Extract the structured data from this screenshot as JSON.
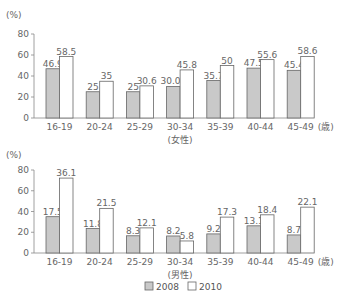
{
  "colors": {
    "bar_2008_fill": "#c9c9c9",
    "bar_2010_fill": "#ffffff",
    "bar_stroke": "#666666",
    "axis": "#888888"
  },
  "legend": [
    {
      "label": "2008",
      "swatch": "gray"
    },
    {
      "label": "2010",
      "swatch": "white"
    }
  ],
  "chart_data": [
    {
      "type": "bar",
      "title": "",
      "subtitle": "(女性)",
      "ylabel": "(%)",
      "xlabel_unit": "(歳)",
      "ylim": [
        0,
        80
      ],
      "yticks": [
        0,
        20,
        40,
        60,
        80
      ],
      "grid": false,
      "legend_position": "bottom",
      "categories": [
        "16-19",
        "20-24",
        "25-29",
        "30-34",
        "35-39",
        "40-44",
        "45-49"
      ],
      "series": [
        {
          "name": "2008",
          "values": [
            46.9,
            25,
            25,
            30.04,
            35.7,
            47.5,
            45.4
          ],
          "labels": [
            "46.9",
            "25",
            "25",
            "30.04",
            "35.7",
            "47.5",
            "45.4"
          ]
        },
        {
          "name": "2010",
          "values": [
            58.5,
            35,
            30.6,
            45.8,
            50,
            55.6,
            58.6
          ],
          "labels": [
            "58.5",
            "35",
            "30.6",
            "45.8",
            "50",
            "55.6",
            "58.6"
          ]
        }
      ],
      "drawn_scale": 1
    },
    {
      "type": "bar",
      "title": "",
      "subtitle": "(男性)",
      "ylabel": "(%)",
      "xlabel_unit": "(歳)",
      "ylim": [
        0,
        80
      ],
      "yticks": [
        0,
        20,
        40,
        60,
        80
      ],
      "grid": false,
      "legend_position": "bottom",
      "categories": [
        "16-19",
        "20-24",
        "25-29",
        "30-34",
        "35-39",
        "40-44",
        "45-49"
      ],
      "series": [
        {
          "name": "2008",
          "values": [
            17.5,
            11.8,
            8.3,
            8.2,
            9.2,
            13.1,
            8.7
          ],
          "labels": [
            "17.5",
            "11.8",
            "8.3",
            "8.2",
            "9.2",
            "13.1",
            "8.7"
          ]
        },
        {
          "name": "2010",
          "values": [
            36.1,
            21.5,
            12.1,
            5.8,
            17.3,
            18.4,
            22.1
          ],
          "labels": [
            "36.1",
            "21.5",
            "12.1",
            "5.8",
            "17.3",
            "18.4",
            "22.1"
          ]
        }
      ],
      "drawn_scale": 2
    }
  ]
}
